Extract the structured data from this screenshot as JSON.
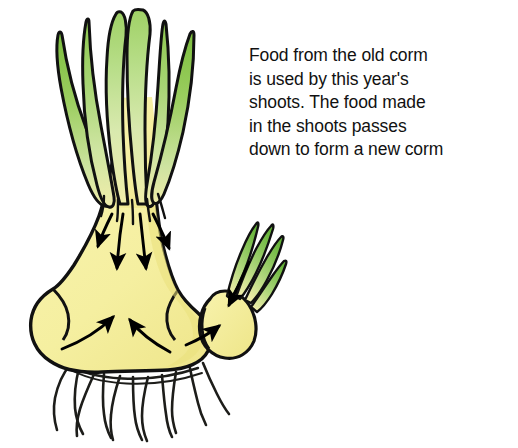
{
  "figure": {
    "name": "corm-food-storage-diagram",
    "background_color": "#ffffff",
    "caption": {
      "full_text": "Food from the old corm is used by this year's shoots. The food made in the shoots passes down to form a new corm",
      "lines": [
        "Food from the old corm",
        "is used by this year's",
        "shoots. The food made",
        "in the shoots passes",
        "down to form a new corm"
      ],
      "text_color": "#111111"
    },
    "colors": {
      "corm_fill": "#f6f0a2",
      "corm_fill_shadow": "#efe68a",
      "leaf_green_dark": "#7cbe3f",
      "leaf_green_mid": "#9ed167",
      "leaf_green_light": "#c8e39b",
      "leaf_pale": "#e8efb2",
      "outline": "#111111",
      "root_color": "#1a1a1a",
      "arrow_color": "#000000"
    },
    "parts": [
      {
        "label": "shoots",
        "description": "green leaf blades rising from the old corm"
      },
      {
        "label": "old-corm",
        "description": "pale yellow swollen storage stem at the base"
      },
      {
        "label": "new-corm",
        "description": "small yellow corm forming at the side with its own green sprout"
      },
      {
        "label": "roots",
        "description": "thin dark roots hanging beneath the old corm"
      },
      {
        "label": "down-arrows",
        "description": "four arrows showing food passing down through the corm"
      },
      {
        "label": "up-arrows",
        "description": "two arrows showing food gathering in the base"
      },
      {
        "label": "new-corm-arrows",
        "description": "arrows showing food entering the new corm"
      }
    ]
  }
}
